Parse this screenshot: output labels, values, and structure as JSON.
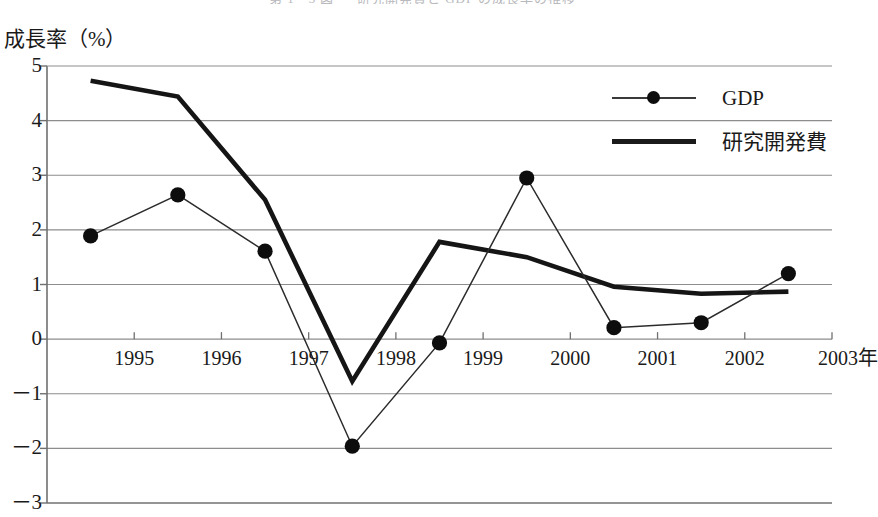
{
  "chart_data": {
    "type": "line",
    "title": "第 1 - 3 図 　 研究開発費と GDP の成長率の推移",
    "xlabel": "",
    "ylabel": "成長率（%）",
    "x_axis_unit_suffix": "年",
    "xlim": [
      1994,
      2003
    ],
    "ylim": [
      -3,
      5
    ],
    "yticks": [
      5,
      4,
      3,
      2,
      1,
      0,
      "－1",
      "－2",
      "－3"
    ],
    "ytick_values": [
      5,
      4,
      3,
      2,
      1,
      0,
      -1,
      -2,
      -3
    ],
    "xticks": [
      "1995",
      "1996",
      "1997",
      "1998",
      "1999",
      "2000",
      "2001",
      "2002",
      "2003"
    ],
    "xtick_values": [
      1995,
      1996,
      1997,
      1998,
      1999,
      2000,
      2001,
      2002,
      2003
    ],
    "grid": true,
    "legend_position": "upper right",
    "series": [
      {
        "name": "GDP",
        "style": "thin-line-with-markers",
        "color": "#2b2b2b",
        "marker": "filled-circle",
        "x": [
          1994.5,
          1995.5,
          1996.5,
          1997.5,
          1998.5,
          1999.5,
          2000.5,
          2001.5,
          2002.5
        ],
        "values": [
          1.89,
          2.64,
          1.61,
          -1.96,
          -0.07,
          2.95,
          0.21,
          0.3,
          1.2
        ]
      },
      {
        "name": "研究開発費",
        "style": "thick-line",
        "color": "#151515",
        "marker": "none",
        "x": [
          1994.5,
          1995.5,
          1996.5,
          1997.5,
          1998.5,
          1999.5,
          2000.5,
          2001.5,
          2002.5
        ],
        "values": [
          4.73,
          4.44,
          2.55,
          -0.77,
          1.78,
          1.5,
          0.96,
          0.83,
          0.87
        ]
      }
    ]
  },
  "legend": {
    "items": [
      {
        "label": "GDP"
      },
      {
        "label": "研究開発費"
      }
    ]
  },
  "colors": {
    "gdp_line": "#2b2b2b",
    "rnd_line": "#151515",
    "grid": "#8d8d8d",
    "axis": "#707070",
    "text": "#1a1a1a",
    "background": "#ffffff"
  }
}
